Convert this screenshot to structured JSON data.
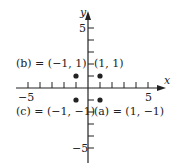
{
  "axes": {
    "x_label": "x",
    "y_label": "y",
    "x_ticks": {
      "min": -5,
      "max": 5,
      "labeled": [
        "-5",
        "5"
      ]
    },
    "y_ticks": {
      "min": -5,
      "max": 5,
      "labeled": [
        "5",
        "-5"
      ]
    }
  },
  "points": [
    {
      "id": "b",
      "x": -1,
      "y": 1,
      "label": "(b) = (−1, 1)"
    },
    {
      "id": "p11",
      "x": 1,
      "y": 1,
      "label": "(1, 1)"
    },
    {
      "id": "c",
      "x": -1,
      "y": -1,
      "label": "(c) = (−1, −1)"
    },
    {
      "id": "a",
      "x": 1,
      "y": -1,
      "label": "(a) = (1, −1)"
    }
  ],
  "tick_labels": {
    "x_neg5": "−5",
    "x_pos5": "5",
    "y_pos5": "5",
    "y_neg5": "−5"
  },
  "colors": {
    "ink": "#222222",
    "background": "#ffffff"
  }
}
